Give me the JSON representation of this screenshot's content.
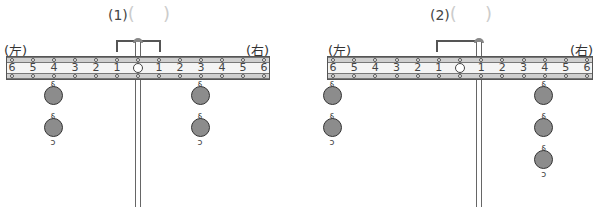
{
  "panels": [
    {
      "id": "1",
      "title": "(1)",
      "left_label": "(左)",
      "right_label": "(右)",
      "tick_labels": [
        "6",
        "5",
        "4",
        "3",
        "2",
        "1",
        "O",
        "1",
        "2",
        "3",
        "4",
        "5",
        "6"
      ],
      "weights": {
        "left": {
          "position": 4,
          "count": 2
        },
        "right": {
          "position": 3,
          "count": 2
        }
      }
    },
    {
      "id": "2",
      "title": "(2)",
      "left_label": "(左)",
      "right_label": "(右)",
      "tick_labels": [
        "6",
        "5",
        "4",
        "3",
        "2",
        "1",
        "O",
        "1",
        "2",
        "3",
        "4",
        "5",
        "6"
      ],
      "weights": {
        "left": {
          "position": 6,
          "count": 2
        },
        "right": {
          "position": 4,
          "count": 3
        }
      }
    }
  ],
  "colors": {
    "weight_fill": "#8c8c8c",
    "beam_rail": "#cfcfcf",
    "outline": "#555555"
  }
}
